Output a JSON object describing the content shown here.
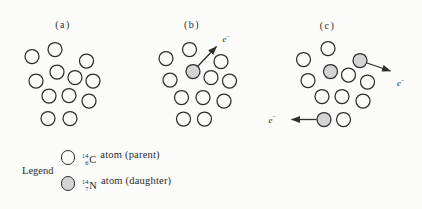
{
  "colors": {
    "background": "#fbfbf9",
    "stroke": "#2d2d2d",
    "parent_fill": "#fbfbf9",
    "daughter_fill": "#d4d4d4",
    "text": "#2b2b2b"
  },
  "atom_radius": 7,
  "atom_stroke_width": 1.25,
  "electron_label": {
    "base": "e",
    "sup": "−"
  },
  "panels": [
    {
      "id": "a",
      "label": "(a)",
      "label_pos": {
        "x": 63,
        "y": 28
      },
      "atoms": [
        {
          "x": 55,
          "y": 49.5,
          "type": "parent"
        },
        {
          "x": 32,
          "y": 56.5,
          "type": "parent"
        },
        {
          "x": 86.5,
          "y": 61,
          "type": "parent"
        },
        {
          "x": 57,
          "y": 72,
          "type": "parent"
        },
        {
          "x": 36,
          "y": 81,
          "type": "parent"
        },
        {
          "x": 75,
          "y": 77.5,
          "type": "parent"
        },
        {
          "x": 93,
          "y": 81,
          "type": "parent"
        },
        {
          "x": 49,
          "y": 96,
          "type": "parent"
        },
        {
          "x": 69,
          "y": 95.5,
          "type": "parent"
        },
        {
          "x": 89,
          "y": 101,
          "type": "parent"
        },
        {
          "x": 48,
          "y": 118.5,
          "type": "parent"
        },
        {
          "x": 70,
          "y": 118.5,
          "type": "parent"
        }
      ],
      "electrons": []
    },
    {
      "id": "b",
      "label": "(b)",
      "label_pos": {
        "x": 192,
        "y": 27.5
      },
      "atoms": [
        {
          "x": 189.5,
          "y": 49.5,
          "type": "parent"
        },
        {
          "x": 166,
          "y": 58.5,
          "type": "parent"
        },
        {
          "x": 221,
          "y": 61.5,
          "type": "parent"
        },
        {
          "x": 193,
          "y": 71.5,
          "type": "daughter"
        },
        {
          "x": 170,
          "y": 80,
          "type": "parent"
        },
        {
          "x": 211,
          "y": 77.5,
          "type": "parent"
        },
        {
          "x": 229.5,
          "y": 81,
          "type": "parent"
        },
        {
          "x": 181.5,
          "y": 97.5,
          "type": "parent"
        },
        {
          "x": 203,
          "y": 97.5,
          "type": "parent"
        },
        {
          "x": 224,
          "y": 101,
          "type": "parent"
        },
        {
          "x": 183.5,
          "y": 119,
          "type": "parent"
        },
        {
          "x": 204.5,
          "y": 119,
          "type": "parent"
        }
      ],
      "electrons": [
        {
          "x1": 197.8,
          "y1": 66.3,
          "x2": 216.5,
          "y2": 46.5,
          "label_x": 222.5,
          "label_y": 42
        }
      ]
    },
    {
      "id": "c",
      "label": "(c)",
      "label_pos": {
        "x": 327.5,
        "y": 28.5
      },
      "atoms": [
        {
          "x": 328,
          "y": 48.5,
          "type": "parent"
        },
        {
          "x": 303.5,
          "y": 59.5,
          "type": "parent"
        },
        {
          "x": 360,
          "y": 60.5,
          "type": "daughter"
        },
        {
          "x": 330.5,
          "y": 71.5,
          "type": "daughter"
        },
        {
          "x": 308,
          "y": 80.5,
          "type": "parent"
        },
        {
          "x": 348.5,
          "y": 75,
          "type": "parent"
        },
        {
          "x": 367.5,
          "y": 82,
          "type": "parent"
        },
        {
          "x": 322,
          "y": 96.5,
          "type": "parent"
        },
        {
          "x": 342,
          "y": 96.5,
          "type": "parent"
        },
        {
          "x": 363,
          "y": 101,
          "type": "parent"
        },
        {
          "x": 324,
          "y": 119.5,
          "type": "daughter"
        },
        {
          "x": 343.5,
          "y": 119.5,
          "type": "parent"
        }
      ],
      "electrons": [
        {
          "x1": 367,
          "y1": 63,
          "x2": 390.5,
          "y2": 71,
          "label_x": 397,
          "label_y": 86
        },
        {
          "x1": 316.5,
          "y1": 119.5,
          "x2": 291.5,
          "y2": 119.5,
          "label_x": 268.5,
          "label_y": 122.5
        }
      ]
    }
  ],
  "legend": {
    "title": "Legend",
    "items": [
      {
        "type": "parent",
        "mass": "14",
        "atomic": "6",
        "symbol": "C",
        "text": "atom (parent)"
      },
      {
        "type": "daughter",
        "mass": "14",
        "atomic": "7",
        "symbol": "N",
        "text": "atom (daughter)"
      }
    ]
  }
}
